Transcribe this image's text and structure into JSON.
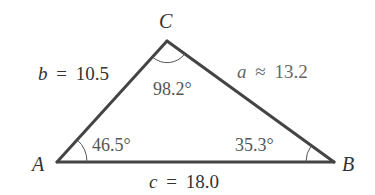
{
  "diagram": {
    "type": "triangle",
    "vertices": {
      "A": {
        "label": "A"
      },
      "B": {
        "label": "B"
      },
      "C": {
        "label": "C"
      }
    },
    "sides": {
      "a": {
        "var": "a",
        "relation": "≈",
        "value": "13.2"
      },
      "b": {
        "var": "b",
        "relation": "=",
        "value": "10.5"
      },
      "c": {
        "var": "c",
        "relation": "=",
        "value": "18.0"
      }
    },
    "angles": {
      "A": "46.5°",
      "B": "35.3°",
      "C": "98.2°"
    },
    "colors": {
      "stroke": "#444444",
      "text": "#333333",
      "angle_text": "#555555"
    }
  }
}
